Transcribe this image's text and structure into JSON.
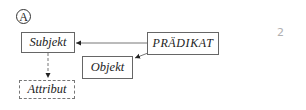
{
  "diagram": {
    "label": "A",
    "nodes": {
      "subjekt": "Subjekt",
      "praedikat": "PRÄDIKAT",
      "objekt": "Objekt",
      "attribut": "Attribut"
    },
    "edges": [
      {
        "from": "PRÄDIKAT",
        "to": "Subjekt",
        "style": "solid"
      },
      {
        "from": "PRÄDIKAT",
        "to": "Objekt",
        "style": "solid"
      },
      {
        "from": "Subjekt",
        "to": "Attribut",
        "style": "dashed"
      }
    ],
    "margin_note": "2"
  }
}
